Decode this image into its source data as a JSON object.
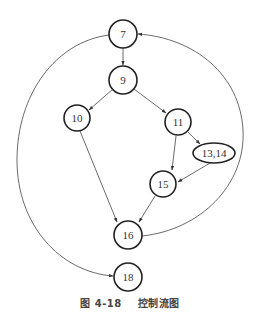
{
  "diagram": {
    "type": "control-flow-graph",
    "nodes": [
      {
        "id": "7",
        "label": "7",
        "cx": 123,
        "cy": 34,
        "shape": "circle"
      },
      {
        "id": "9",
        "label": "9",
        "cx": 123,
        "cy": 80,
        "shape": "circle"
      },
      {
        "id": "10",
        "label": "10",
        "cx": 77,
        "cy": 118,
        "shape": "circle"
      },
      {
        "id": "11",
        "label": "11",
        "cx": 178,
        "cy": 122,
        "shape": "circle"
      },
      {
        "id": "13_14",
        "label": "13,14",
        "cx": 214,
        "cy": 153,
        "shape": "ellipse"
      },
      {
        "id": "15",
        "label": "15",
        "cx": 163,
        "cy": 184,
        "shape": "circle"
      },
      {
        "id": "16",
        "label": "16",
        "cx": 128,
        "cy": 235,
        "shape": "circle"
      },
      {
        "id": "18",
        "label": "18",
        "cx": 128,
        "cy": 277,
        "shape": "circle"
      }
    ],
    "edges": [
      {
        "from": "7",
        "to": "9"
      },
      {
        "from": "9",
        "to": "10"
      },
      {
        "from": "9",
        "to": "11"
      },
      {
        "from": "10",
        "to": "16"
      },
      {
        "from": "11",
        "to": "13,14"
      },
      {
        "from": "11",
        "to": "15"
      },
      {
        "from": "13,14",
        "to": "15"
      },
      {
        "from": "15",
        "to": "16"
      },
      {
        "from": "16",
        "to": "7",
        "curved": true
      },
      {
        "from": "7",
        "to": "18",
        "curved": true
      }
    ]
  },
  "caption": {
    "figure_number": "图 4-18",
    "title": "控制流图"
  }
}
